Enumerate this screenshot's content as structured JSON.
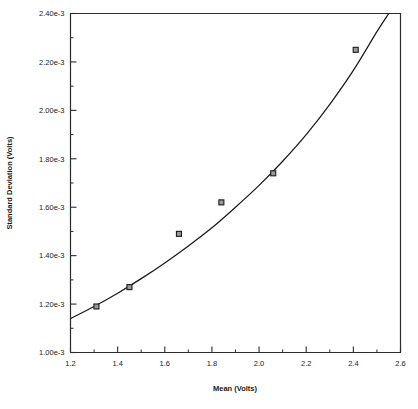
{
  "chart_data": {
    "type": "scatter",
    "title": "",
    "subtitle": "",
    "xlabel": "Mean   (Volts)",
    "ylabel": "Standard   Deviation   (Volts)",
    "xlim": [
      1.2,
      2.6
    ],
    "ylim": [
      0.001,
      0.0024
    ],
    "grid": false,
    "legend_position": "none",
    "x_tick_labels": [
      "1.2",
      "1.4",
      "1.6",
      "1.8",
      "2.0",
      "2.2",
      "2.4",
      "2.6"
    ],
    "x_tick_values": [
      1.2,
      1.4,
      1.6,
      1.8,
      2.0,
      2.2,
      2.4,
      2.6
    ],
    "x_minor_tick_values": [
      1.3,
      1.5,
      1.7,
      1.9,
      2.1,
      2.3,
      2.5
    ],
    "y_tick_labels": [
      "1.00e-3",
      "1.20e-3",
      "1.40e-3",
      "1.60e-3",
      "1.80e-3",
      "2.00e-3",
      "2.20e-3",
      "2.40e-3"
    ],
    "y_tick_values": [
      0.001,
      0.0012,
      0.0014,
      0.0016,
      0.0018,
      0.002,
      0.0022,
      0.0024
    ],
    "y_minor_tick_values": [
      0.0011,
      0.0013,
      0.0015,
      0.0017,
      0.0019,
      0.0021,
      0.0023
    ],
    "series": [
      {
        "name": "measured points",
        "type": "scatter",
        "marker": "square",
        "marker_color": "#9a9a9a",
        "marker_edge_color": "#1a1a1a",
        "x": [
          1.31,
          1.45,
          1.66,
          1.84,
          2.06,
          2.41
        ],
        "y": [
          0.00119,
          0.00127,
          0.00149,
          0.00162,
          0.00174,
          0.00225
        ]
      },
      {
        "name": "fitted curve",
        "type": "line",
        "line_color": "#1a1a1a",
        "x": [
          1.2,
          1.3,
          1.4,
          1.5,
          1.6,
          1.7,
          1.8,
          1.9,
          2.0,
          2.1,
          2.2,
          2.3,
          2.4,
          2.5,
          2.55
        ],
        "y": [
          0.00114,
          0.00119,
          0.001245,
          0.001305,
          0.00137,
          0.00144,
          0.001515,
          0.0016,
          0.00169,
          0.00179,
          0.0019,
          0.002025,
          0.002165,
          0.002325,
          0.0024
        ]
      }
    ]
  },
  "axes": {
    "x_title": "Mean   (Volts)",
    "y_title": "Standard   Deviation   (Volts)"
  },
  "colors": {
    "axis": "#2b2b2b",
    "curve": "#1a1a1a",
    "marker_fill": "#9a9a9a",
    "marker_edge": "#1a1a1a",
    "background": "#ffffff"
  }
}
